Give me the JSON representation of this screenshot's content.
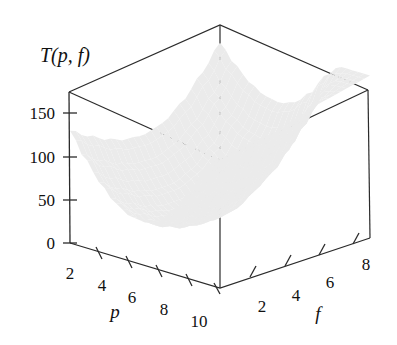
{
  "figure": {
    "title": "T(p, f)",
    "background": "#ffffff",
    "ink_color": "#1a1a1a",
    "surface_fill": "#ebebeb"
  },
  "chart_data": {
    "type": "surface",
    "title": "T(p, f)",
    "xlabel": "p",
    "ylabel": "f",
    "zlabel": "T(p, f)",
    "projection": "3d-perspective",
    "grid": false,
    "legend": "none",
    "x_ticks": [
      2,
      4,
      6,
      8,
      10
    ],
    "y_ticks": [
      2,
      4,
      6,
      8
    ],
    "z_ticks": [
      0,
      50,
      100,
      150
    ],
    "xlim": [
      1,
      11
    ],
    "ylim": [
      1,
      9
    ],
    "zlim": [
      0,
      175
    ],
    "surface_samples": {
      "p": [
        1,
        2,
        3,
        4,
        5,
        6,
        7,
        8,
        9,
        10,
        11
      ],
      "f": [
        1,
        2,
        3,
        4,
        5,
        6,
        7,
        8,
        9
      ],
      "T": [
        [
          130,
          112,
          96,
          84,
          78,
          80,
          92,
          112,
          136
        ],
        [
          103,
          84,
          68,
          57,
          52,
          56,
          69,
          90,
          116
        ],
        [
          80,
          61,
          46,
          35,
          31,
          36,
          50,
          72,
          100
        ],
        [
          62,
          44,
          29,
          19,
          16,
          22,
          37,
          60,
          90
        ],
        [
          52,
          34,
          20,
          11,
          9,
          16,
          32,
          56,
          87
        ],
        [
          50,
          33,
          20,
          12,
          11,
          19,
          36,
          61,
          93
        ],
        [
          58,
          42,
          30,
          23,
          23,
          32,
          50,
          76,
          109
        ],
        [
          76,
          60,
          49,
          43,
          44,
          54,
          73,
          100,
          134
        ],
        [
          102,
          87,
          76,
          71,
          73,
          84,
          104,
          132,
          150
        ],
        [
          134,
          120,
          110,
          106,
          109,
          121,
          142,
          150,
          150
        ],
        [
          150,
          150,
          148,
          145,
          148,
          150,
          150,
          150,
          150
        ]
      ],
      "note": "Values read approximately from the rendered surface against the 0-150 z-axis."
    },
    "mesh": {
      "u_divisions": 26,
      "v_divisions": 26,
      "style": "wireframe-with-fill"
    }
  },
  "axes": {
    "z": {
      "label": "T(p, f)",
      "ticks": [
        {
          "value": "150"
        },
        {
          "value": "100"
        },
        {
          "value": "50"
        },
        {
          "value": "0"
        }
      ]
    },
    "p": {
      "label": "p",
      "ticks": [
        {
          "value": "2"
        },
        {
          "value": "4"
        },
        {
          "value": "6"
        },
        {
          "value": "8"
        },
        {
          "value": "10"
        }
      ]
    },
    "f": {
      "label": "f",
      "ticks": [
        {
          "value": "2"
        },
        {
          "value": "4"
        },
        {
          "value": "6"
        },
        {
          "value": "8"
        }
      ]
    }
  }
}
